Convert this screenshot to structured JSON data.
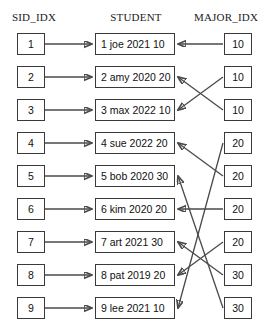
{
  "columns": {
    "left": {
      "header": "SID_IDX",
      "entries": [
        {
          "label": "1"
        },
        {
          "label": "2"
        },
        {
          "label": "3"
        },
        {
          "label": "4"
        },
        {
          "label": "5"
        },
        {
          "label": "6"
        },
        {
          "label": "7"
        },
        {
          "label": "8"
        },
        {
          "label": "9"
        }
      ]
    },
    "middle": {
      "header": "STUDENT",
      "entries": [
        {
          "label": "1 joe 2021 10",
          "sid": "1",
          "name": "joe",
          "year": "2021",
          "major": "10"
        },
        {
          "label": "2 amy 2020 20",
          "sid": "2",
          "name": "amy",
          "year": "2020",
          "major": "20"
        },
        {
          "label": "3 max 2022 10",
          "sid": "3",
          "name": "max",
          "year": "2022",
          "major": "10"
        },
        {
          "label": "4 sue 2022 20",
          "sid": "4",
          "name": "sue",
          "year": "2022",
          "major": "20"
        },
        {
          "label": "5 bob 2020 30",
          "sid": "5",
          "name": "bob",
          "year": "2020",
          "major": "30"
        },
        {
          "label": "6 kim 2020 20",
          "sid": "6",
          "name": "kim",
          "year": "2020",
          "major": "20"
        },
        {
          "label": "7 art 2021 30",
          "sid": "7",
          "name": "art",
          "year": "2021",
          "major": "30"
        },
        {
          "label": "8 pat 2019 20",
          "sid": "8",
          "name": "pat",
          "year": "2019",
          "major": "20"
        },
        {
          "label": "9 lee 2021 10",
          "sid": "9",
          "name": "lee",
          "year": "2021",
          "major": "10"
        }
      ]
    },
    "right": {
      "header": "MAJOR_IDX",
      "entries": [
        {
          "label": "10"
        },
        {
          "label": "10"
        },
        {
          "label": "10"
        },
        {
          "label": "20"
        },
        {
          "label": "20"
        },
        {
          "label": "20"
        },
        {
          "label": "20"
        },
        {
          "label": "30"
        },
        {
          "label": "30"
        }
      ]
    }
  },
  "colors": {
    "background": "#ffffff",
    "box_border": "#3a3a3a",
    "line": "#4a4a4a",
    "text": "#111111"
  }
}
